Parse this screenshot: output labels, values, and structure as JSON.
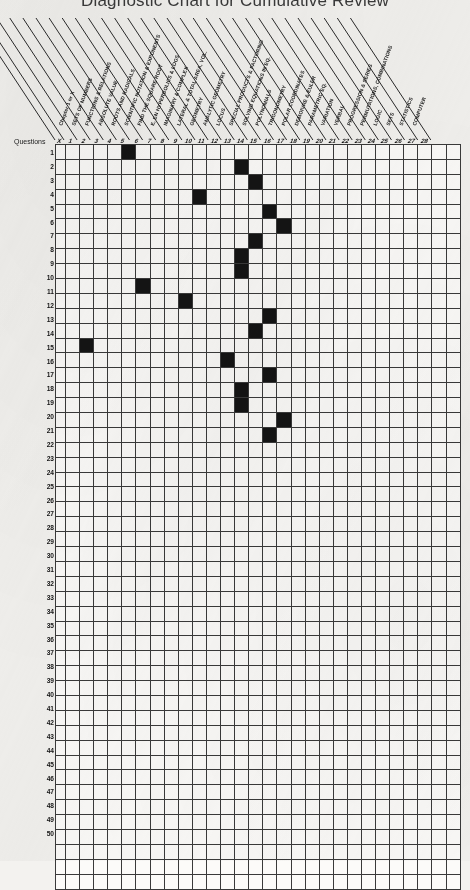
{
  "title": "Diagnostic Chart for Cumulative Review",
  "axis": {
    "row_header_label": "Questions",
    "first_column_label": "Chapter 1 or X",
    "first_column_number": "X"
  },
  "columns": [
    {
      "number": "1",
      "label": "SETS OF NUMBERS"
    },
    {
      "number": "2",
      "label": "FUNCTIONS & RELATIONS"
    },
    {
      "number": "3",
      "label": "ABSOLUTE VALUE"
    },
    {
      "number": "4",
      "label": "ROOTS AND RADICALS"
    },
    {
      "number": "5",
      "label": "SCIENTIFIC NOTATION & EXPONENTS"
    },
    {
      "number": "6",
      "label": "FIND THE SQUARE ROOT"
    },
    {
      "number": "7",
      "label": "E, EN HYPERBOLICS & LOGS"
    },
    {
      "number": "8",
      "label": "IMAGINARY & COMPLEX"
    },
    {
      "number": "9",
      "label": "LATERAL & TOTAL AREA, VOL."
    },
    {
      "number": "10",
      "label": "GEOMETRY"
    },
    {
      "number": "11",
      "label": "ANALYTIC GEOMETRY"
    },
    {
      "number": "12",
      "label": "LOCUS"
    },
    {
      "number": "13",
      "label": "SPECIAL PRODUCTS & FACTORING"
    },
    {
      "number": "14",
      "label": "SOLVING EQUATIONS IN EQ."
    },
    {
      "number": "15",
      "label": "POLYNOMIALS"
    },
    {
      "number": "16",
      "label": "TRIGONOMETRY"
    },
    {
      "number": "17",
      "label": "POLAR COORDINATES"
    },
    {
      "number": "18",
      "label": "DEMOIVRE & EULER"
    },
    {
      "number": "19",
      "label": "PARAMETRIC EQ."
    },
    {
      "number": "20",
      "label": "VARIATION"
    },
    {
      "number": "21",
      "label": "VERBAL"
    },
    {
      "number": "22",
      "label": "PROGRESSION & SERIES"
    },
    {
      "number": "23",
      "label": "PERMUTATIONS, COMBINATIONS"
    },
    {
      "number": "24",
      "label": "LOGIC"
    },
    {
      "number": "25",
      "label": "SETS"
    },
    {
      "number": "26",
      "label": "STATISTICS"
    },
    {
      "number": "27",
      "label": "COMPUTER"
    },
    {
      "number": "28",
      "label": ""
    }
  ],
  "chart_data": {
    "type": "heatmap",
    "title": "Diagnostic Chart for Cumulative Review",
    "xlabel": "",
    "ylabel": "Questions",
    "grid": true,
    "legend": "",
    "x_categories": [
      "X",
      "1",
      "2",
      "3",
      "4",
      "5",
      "6",
      "7",
      "8",
      "9",
      "10",
      "11",
      "12",
      "13",
      "14",
      "15",
      "16",
      "17",
      "18",
      "19",
      "20",
      "21",
      "22",
      "23",
      "24",
      "25",
      "26",
      "27",
      "28"
    ],
    "y_categories": [
      "1",
      "2",
      "3",
      "4",
      "5",
      "6",
      "7",
      "8",
      "9",
      "10",
      "11",
      "12",
      "13",
      "14",
      "15",
      "16",
      "17",
      "18",
      "19",
      "20",
      "21",
      "22",
      "23",
      "24",
      "25",
      "26",
      "27",
      "28",
      "29",
      "30",
      "31",
      "32",
      "33",
      "34",
      "35",
      "36",
      "37",
      "38",
      "39",
      "40",
      "41",
      "42",
      "43",
      "44",
      "45",
      "46",
      "47",
      "48",
      "49",
      "50"
    ],
    "n_rows": 50,
    "n_cols": 28,
    "fill_color": "#141414",
    "empty_color": "#fcfbf9",
    "marked_cells": [
      {
        "row": 1,
        "col": 5
      },
      {
        "row": 2,
        "col": 13
      },
      {
        "row": 3,
        "col": 14
      },
      {
        "row": 4,
        "col": 10
      },
      {
        "row": 5,
        "col": 15
      },
      {
        "row": 6,
        "col": 16
      },
      {
        "row": 7,
        "col": 14
      },
      {
        "row": 8,
        "col": 13
      },
      {
        "row": 9,
        "col": 13
      },
      {
        "row": 10,
        "col": 6
      },
      {
        "row": 11,
        "col": 9
      },
      {
        "row": 12,
        "col": 15
      },
      {
        "row": 13,
        "col": 14
      },
      {
        "row": 14,
        "col": 2
      },
      {
        "row": 15,
        "col": 12
      },
      {
        "row": 16,
        "col": 15
      },
      {
        "row": 17,
        "col": 13
      },
      {
        "row": 18,
        "col": 13
      },
      {
        "row": 19,
        "col": 16
      },
      {
        "row": 20,
        "col": 15
      }
    ]
  }
}
